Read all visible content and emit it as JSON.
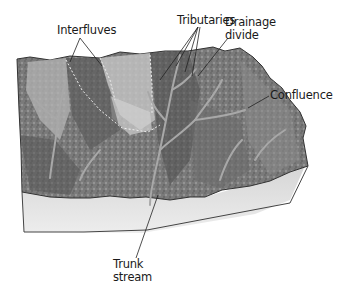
{
  "figure": {
    "labels": {
      "interfluves": "Interfluves",
      "tributaries": "Tributaries",
      "drainage_divide_line1": "Drainage",
      "drainage_divide_line2": "divide",
      "confluence": "Confluence",
      "trunk_stream_line1": "Trunk",
      "trunk_stream_line2": "stream"
    },
    "colors": {
      "background": "#ffffff",
      "terrain_dark": "#5a5a5a",
      "terrain_mid": "#8c8c8c",
      "terrain_light": "#c8c8c8",
      "block_side": "#dcdcdc",
      "leader_line": "#222222"
    }
  }
}
